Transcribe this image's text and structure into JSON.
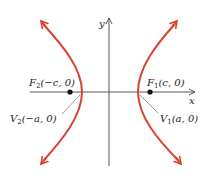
{
  "diagram": {
    "type": "hyperbola",
    "colors": {
      "curve": "#d9432f",
      "axis": "#444444",
      "point": "#111111",
      "leader": "#555555"
    },
    "axes": {
      "x_label": "x",
      "y_label": "y"
    },
    "labels": {
      "F2": {
        "name": "F",
        "sub": "2",
        "coords": "(−c, 0)"
      },
      "F1": {
        "name": "F",
        "sub": "1",
        "coords": "(c, 0)"
      },
      "V2": {
        "name": "V",
        "sub": "2",
        "coords": "(−a, 0)"
      },
      "V1": {
        "name": "V",
        "sub": "1",
        "coords": "(a, 0)"
      }
    }
  }
}
